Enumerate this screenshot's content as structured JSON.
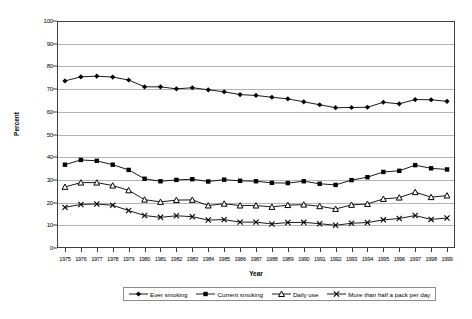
{
  "chart_data": {
    "type": "line",
    "title": "",
    "xlabel": "Year",
    "ylabel": "Percent",
    "ylim": [
      0,
      100
    ],
    "ytick_step": 10,
    "yticks": [
      0,
      10,
      20,
      30,
      40,
      50,
      60,
      70,
      80,
      90,
      100
    ],
    "grid": true,
    "legend_position": "bottom",
    "categories": [
      "1975",
      "1976",
      "1977",
      "1978",
      "1979",
      "1980",
      "1981",
      "1982",
      "1983",
      "1984",
      "1985",
      "1986",
      "1987",
      "1988",
      "1989",
      "1990",
      "1991",
      "1992",
      "1993",
      "1994",
      "1995",
      "1996",
      "1997",
      "1998",
      "1999"
    ],
    "series": [
      {
        "name": "Ever smoking",
        "marker": "diamond",
        "color": "#000000",
        "values": [
          73.6,
          75.4,
          75.7,
          75.3,
          74.0,
          71.0,
          71.0,
          70.1,
          70.6,
          69.7,
          68.8,
          67.6,
          67.2,
          66.4,
          65.7,
          64.4,
          63.1,
          61.8,
          61.9,
          62.0,
          64.2,
          63.5,
          65.4,
          65.3,
          64.6
        ]
      },
      {
        "name": "Current smoking",
        "marker": "square",
        "color": "#000000",
        "values": [
          36.7,
          38.8,
          38.4,
          36.7,
          34.4,
          30.5,
          29.4,
          30.0,
          30.3,
          29.3,
          30.1,
          29.6,
          29.4,
          28.7,
          28.6,
          29.4,
          28.3,
          27.8,
          29.9,
          31.2,
          33.5,
          34.0,
          36.5,
          35.1,
          34.6
        ]
      },
      {
        "name": "Daily use",
        "marker": "triangle",
        "color": "#000000",
        "values": [
          26.9,
          28.8,
          28.8,
          27.5,
          25.4,
          21.3,
          20.3,
          21.1,
          21.2,
          18.7,
          19.5,
          18.7,
          18.7,
          18.1,
          18.9,
          19.1,
          18.4,
          17.2,
          19.0,
          19.4,
          21.6,
          22.2,
          24.6,
          22.4,
          23.1
        ]
      },
      {
        "name": "More than half a pack per day",
        "marker": "cross",
        "color": "#000000",
        "values": [
          17.9,
          19.2,
          19.4,
          18.8,
          16.5,
          14.3,
          13.5,
          14.2,
          13.8,
          12.3,
          12.5,
          11.4,
          11.4,
          10.6,
          11.2,
          11.3,
          10.7,
          10.0,
          10.9,
          11.2,
          12.4,
          13.0,
          14.3,
          12.6,
          13.2
        ]
      }
    ]
  },
  "axis": {
    "y_title": "Percent",
    "x_title": "Year"
  },
  "legend": {
    "items": [
      {
        "label": "Ever smoking",
        "marker": "diamond"
      },
      {
        "label": "Current smoking",
        "marker": "square"
      },
      {
        "label": "Daily use",
        "marker": "triangle"
      },
      {
        "label": "More than half a pack per day",
        "marker": "cross"
      }
    ]
  }
}
